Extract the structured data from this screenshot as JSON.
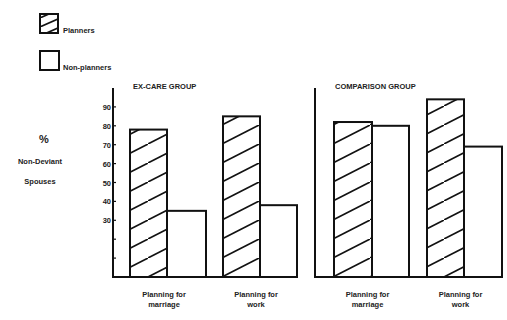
{
  "chart_data": {
    "type": "bar",
    "title": "",
    "ylabel": "% Non-Deviant Spouses",
    "ylabel_lines": [
      "%",
      "Non-Deviant",
      "Spouses"
    ],
    "ylim": [
      0,
      100
    ],
    "yticks": [
      10,
      20,
      30,
      40,
      50,
      60,
      70,
      80,
      90
    ],
    "ytick_labels": [
      "",
      "",
      "30",
      "40",
      "50",
      "60",
      "70",
      "80",
      "90"
    ],
    "legend": {
      "position": "top-left",
      "entries": [
        {
          "name": "Planners",
          "pattern": "hatched"
        },
        {
          "name": "Non-planners",
          "pattern": "empty"
        }
      ]
    },
    "panels": [
      {
        "title": "EX-CARE GROUP",
        "categories": [
          {
            "lines": [
              "Planning for",
              "marriage"
            ]
          },
          {
            "lines": [
              "Planning for",
              "work"
            ]
          }
        ],
        "series": [
          {
            "name": "Planners",
            "values": [
              78,
              85
            ]
          },
          {
            "name": "Non-planners",
            "values": [
              35,
              38
            ]
          }
        ]
      },
      {
        "title": "COMPARISON GROUP",
        "categories": [
          {
            "lines": [
              "Planning for",
              "marriage"
            ]
          },
          {
            "lines": [
              "Planning for",
              "work"
            ]
          }
        ],
        "series": [
          {
            "name": "Planners",
            "values": [
              82,
              94
            ]
          },
          {
            "name": "Non-planners",
            "values": [
              80,
              69
            ]
          }
        ]
      }
    ],
    "grid": false
  }
}
